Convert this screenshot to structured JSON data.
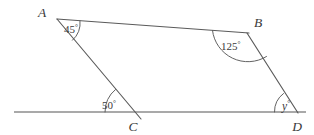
{
  "figure": {
    "background_color": "#ffffff",
    "line_color": "#5a5a5a",
    "baseline_color": "#8d8d8d",
    "text_color": "#3a3a3a"
  },
  "vertices": {
    "a": {
      "label": "A",
      "x": 57,
      "y": 19
    },
    "b": {
      "label": "B",
      "x": 248,
      "y": 33
    },
    "c": {
      "label": "C",
      "x": 134,
      "y": 112
    },
    "d": {
      "label": "D",
      "x": 297,
      "y": 112
    }
  },
  "vertex_labels": {
    "a": {
      "text": "A",
      "x": 45,
      "y": 16
    },
    "b": {
      "text": "B",
      "x": 256,
      "y": 27
    },
    "c": {
      "text": "C",
      "x": 131,
      "y": 130
    },
    "d": {
      "text": "D",
      "x": 296,
      "y": 130
    }
  },
  "angles": {
    "at_a": {
      "value": "45",
      "degree_symbol": "°",
      "x": 66,
      "y": 32,
      "vertex": "A"
    },
    "at_b": {
      "value": "125",
      "degree_symbol": "°",
      "x": 222,
      "y": 49,
      "vertex": "B"
    },
    "at_c": {
      "value": "50",
      "degree_symbol": "°",
      "x": 104,
      "y": 108,
      "vertex": "C"
    },
    "at_d": {
      "value": "y",
      "degree_symbol": "°",
      "x": 283,
      "y": 109,
      "vertex": "D"
    }
  },
  "segments": {
    "ab": {
      "name": "segment-a-b",
      "x1": 57,
      "y1": 19,
      "x2": 249,
      "y2": 33
    },
    "a_through_c": {
      "name": "segment-a-through-c",
      "x1": 57,
      "y1": 19,
      "x2": 141,
      "y2": 119
    },
    "b_to_d": {
      "name": "segment-b-d",
      "x1": 247,
      "y1": 33,
      "x2": 298,
      "y2": 113
    },
    "baseline": {
      "name": "horizontal-baseline",
      "x1": 14,
      "y1": 112,
      "x2": 306,
      "y2": 112
    }
  },
  "arcs": {
    "arc_a": {
      "name": "angle-arc-a",
      "path": "M 75 22 A 20 20 0 0 1 70 37"
    },
    "arc_b": {
      "name": "angle-arc-b",
      "path": "M 214 37 A 36 36 0 0 0 246 70"
    },
    "arc_c": {
      "name": "angle-arc-c",
      "path": "M 106 112 A 28 28 0 0 1 123 90"
    },
    "arc_d": {
      "name": "angle-arc-d",
      "path": "M 275 112 A 22 22 0 0 1 287 92"
    }
  }
}
